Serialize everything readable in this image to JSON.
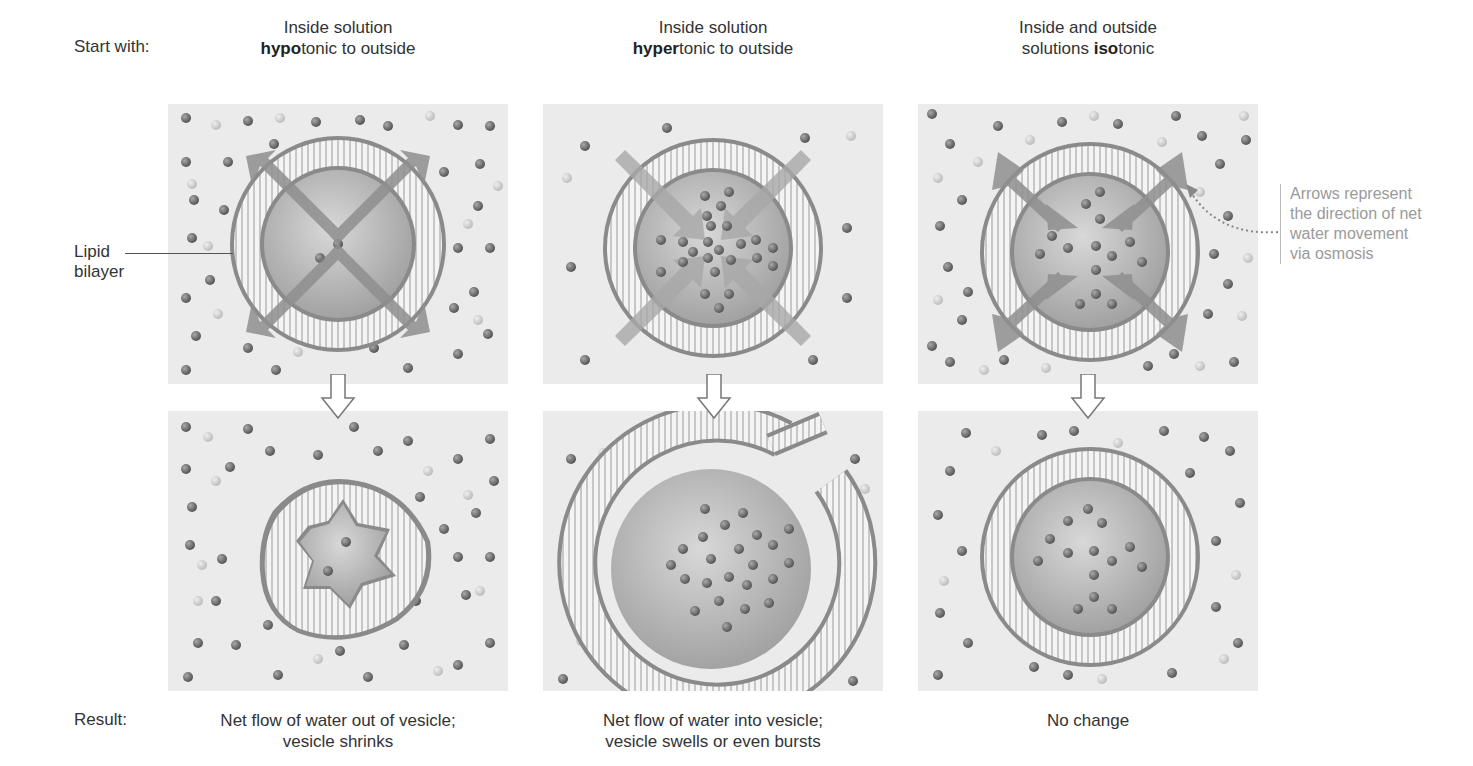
{
  "row_labels": {
    "start": "Start with:",
    "result": "Result:"
  },
  "columns": [
    {
      "id": "hypotonic",
      "title_line1": "Inside solution",
      "title_bold": "hypo",
      "title_rest": "tonic to outside",
      "result_line1": "Net flow of water out of vesicle;",
      "result_line2": "vesicle shrinks"
    },
    {
      "id": "hypertonic",
      "title_line1": "Inside solution",
      "title_bold": "hyper",
      "title_rest": "tonic to outside",
      "result_line1": "Net flow of water into vesicle;",
      "result_line2": "vesicle swells or even bursts"
    },
    {
      "id": "isotonic",
      "title_line1": "Inside and outside",
      "title_prefix": "solutions ",
      "title_bold": "iso",
      "title_rest": "tonic",
      "result_line1": "No change",
      "result_line2": ""
    }
  ],
  "labels": {
    "lipid_line1": "Lipid",
    "lipid_line2": "bilayer"
  },
  "note": {
    "line1": "Arrows represent",
    "line2": "the direction of net",
    "line3": "water movement",
    "line4": "via osmosis"
  },
  "colors": {
    "panel_bg": "#ebebeb",
    "solute_dark": "#6f6f6f",
    "solute_light": "#c9c9c9",
    "membrane": "#8a8a8a",
    "arrow": "#8f8f8f",
    "note_text": "#9a9a9a"
  }
}
